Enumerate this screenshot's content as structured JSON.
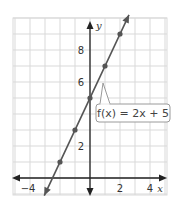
{
  "chart_data": {
    "type": "line",
    "title": "",
    "function_label": "f(x) = 2x + 5",
    "equation": {
      "slope": 2,
      "intercept": 5
    },
    "xlabel": "x",
    "ylabel": "y",
    "xlim": [
      -5,
      5
    ],
    "ylim": [
      -1,
      10
    ],
    "grid": true,
    "x_tick_labels": [
      {
        "value": -4,
        "label": "−4"
      },
      {
        "value": 2,
        "label": "2"
      },
      {
        "value": 4,
        "label": "4"
      }
    ],
    "y_tick_labels": [
      {
        "value": 2,
        "label": "2"
      },
      {
        "value": 6,
        "label": "6"
      },
      {
        "value": 8,
        "label": "8"
      }
    ],
    "points": [
      {
        "x": -2,
        "y": 1
      },
      {
        "x": -1,
        "y": 3
      },
      {
        "x": 0,
        "y": 5
      },
      {
        "x": 1,
        "y": 7
      },
      {
        "x": 2,
        "y": 9
      }
    ],
    "line_extent": {
      "x_start": -3.05,
      "x_end": 2.6
    }
  },
  "colors": {
    "grid": "#d9d9d9",
    "axis": "#222222",
    "line": "#555555",
    "point": "#555555",
    "callout_border": "#9a9a9a"
  },
  "labels": {
    "function": "f(x) = 2x + 5",
    "x_axis": "x",
    "y_axis": "y"
  }
}
